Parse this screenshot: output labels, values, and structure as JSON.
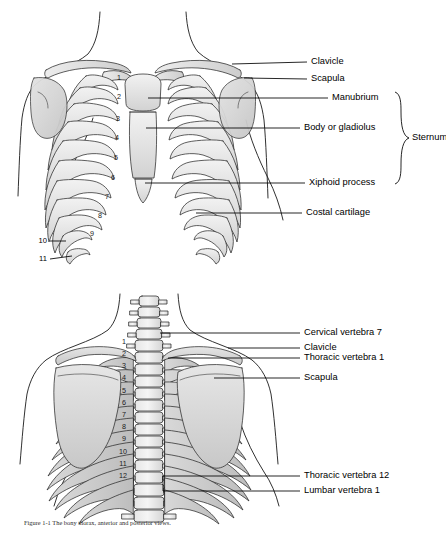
{
  "figure": {
    "anterior": {
      "name": "Anterior view of thoracic cage",
      "labels": [
        {
          "id": "clavicle",
          "text": "Clavicle"
        },
        {
          "id": "scapula",
          "text": "Scapula"
        },
        {
          "id": "manubrium",
          "text": "Manubrium"
        },
        {
          "id": "body-gladiolus",
          "text": "Body or gladiolus"
        },
        {
          "id": "xiphoid-process",
          "text": "Xiphoid process"
        },
        {
          "id": "costal-cartilage",
          "text": "Costal cartilage"
        }
      ],
      "group_brace": {
        "id": "sternum",
        "text": "Sternum",
        "members": [
          "Manubrium",
          "Body or gladiolus",
          "Xiphoid process"
        ]
      },
      "rib_numbers_inner": [
        "1",
        "2",
        "3",
        "4",
        "5",
        "6",
        "7",
        "8",
        "9"
      ],
      "rib_numbers_outer": [
        "10",
        "11"
      ]
    },
    "posterior": {
      "name": "Posterior view of thoracic cage",
      "labels": [
        {
          "id": "cervical-vertebra-7",
          "text": "Cervical vertebra 7"
        },
        {
          "id": "clavicle",
          "text": "Clavicle"
        },
        {
          "id": "thoracic-vertebra-1",
          "text": "Thoracic vertebra 1"
        },
        {
          "id": "scapula",
          "text": "Scapula"
        },
        {
          "id": "thoracic-vertebra-12",
          "text": "Thoracic vertebra 12"
        },
        {
          "id": "lumbar-vertebra-1",
          "text": "Lumbar vertebra 1"
        }
      ],
      "rib_numbers": [
        "1",
        "2",
        "3",
        "4",
        "5",
        "6",
        "7",
        "8",
        "9",
        "10",
        "11",
        "12"
      ]
    }
  },
  "caption": {
    "text": "Figure 1-1  The bony thorax, anterior and posterior views."
  },
  "colors": {
    "bone_fill": "#e8e8e8",
    "bone_shade": "#cfcfcf",
    "cartilage_fill": "#dcdcdc",
    "outline": "#1a1a1a",
    "text": "#000000"
  }
}
